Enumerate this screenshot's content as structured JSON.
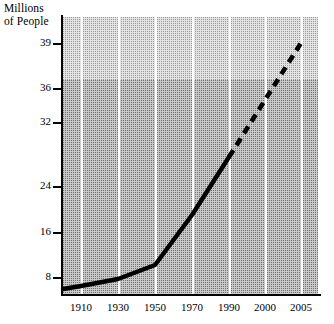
{
  "chart_data": {
    "type": "line",
    "title": "Millions of People",
    "ylabel": "Millions of People",
    "xlabel": "",
    "grid": "vertical-white-gridlines",
    "legend": "none",
    "x_tick_labels": [
      "1910",
      "1930",
      "1950",
      "1970",
      "1990",
      "2000",
      "2005"
    ],
    "y_tick_labels": [
      "39",
      "36",
      "32",
      "24",
      "16",
      "8"
    ],
    "y_tick_values": [
      39,
      36,
      32,
      24,
      16,
      8
    ],
    "x_axis_note": "non-linear spacing: equal pixel steps between 1910,1930,1950,1970,1990,2000,2005",
    "y_axis_note": "non-linear spacing: 8,16,24 evenly spaced; 32,36,39 compressed toward top",
    "series": [
      {
        "name": "Population",
        "style": "solid",
        "note": "historical observed data",
        "points": [
          {
            "x": "1900",
            "y": 6.2
          },
          {
            "x": "1910",
            "y": 7.2
          },
          {
            "x": "1930",
            "y": 8.6
          },
          {
            "x": "1950",
            "y": 10.9
          },
          {
            "x": "1970",
            "y": 18.5
          },
          {
            "x": "1990",
            "y": 27.5
          }
        ]
      },
      {
        "name": "Population (projected)",
        "style": "dashed",
        "note": "projected future data",
        "points": [
          {
            "x": "1990",
            "y": 27.5
          },
          {
            "x": "2005",
            "y": 39.0
          }
        ]
      }
    ],
    "ylim": [
      4,
      40
    ],
    "xlim": [
      "1900",
      "2008"
    ]
  },
  "chart": {
    "axis_title_text": "Millions\nof People",
    "y_ticks": [
      {
        "label": "39",
        "py": 43
      },
      {
        "label": "36",
        "py": 88
      },
      {
        "label": "32",
        "py": 122
      },
      {
        "label": "24",
        "py": 186
      },
      {
        "label": "16",
        "py": 232
      },
      {
        "label": "8",
        "py": 277
      }
    ],
    "x_ticks": [
      {
        "label": "1910",
        "px": 81
      },
      {
        "label": "1930",
        "px": 118
      },
      {
        "label": "1950",
        "px": 155
      },
      {
        "label": "1970",
        "px": 192
      },
      {
        "label": "1990",
        "px": 229
      },
      {
        "label": "2000",
        "px": 265
      },
      {
        "label": "2005",
        "px": 301
      }
    ],
    "colors": {
      "line": "#000000",
      "axis": "#000000",
      "gridline": "#ffffff",
      "band_light": "#e3e3e3",
      "band_dark": "#c9c9c9",
      "page_background": "#ffffff"
    }
  }
}
